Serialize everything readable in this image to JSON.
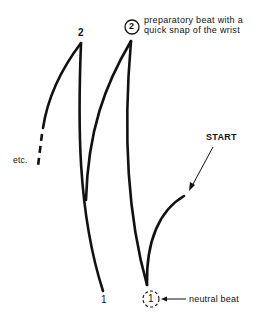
{
  "diagram": {
    "type": "conducting-pattern",
    "labels": {
      "beat_two": "2",
      "beat_one": "1",
      "neutral_beat_number": "1",
      "circled_prep_number": "2",
      "prep_note_line1": "preparatory beat with a",
      "prep_note_line2": "quick snap of the wrist",
      "start": "START",
      "neutral_beat": "neutral beat",
      "etc": "etc."
    },
    "colors": {
      "stroke": "#111111",
      "background": "#ffffff"
    }
  }
}
